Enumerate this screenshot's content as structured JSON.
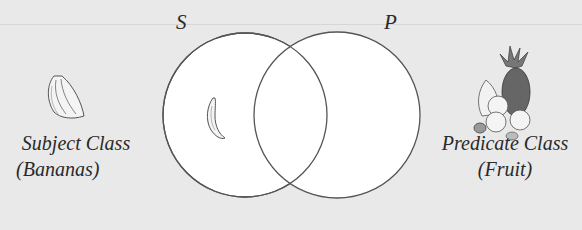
{
  "diagram": {
    "type": "venn",
    "circles": [
      {
        "id": "S",
        "label": "S",
        "cx": 245,
        "cy": 115,
        "r": 82
      },
      {
        "id": "P",
        "label": "P",
        "cx": 337,
        "cy": 115,
        "r": 83
      }
    ],
    "subject": {
      "title": "Subject Class",
      "subtitle": "(Bananas)",
      "icon": "banana-bunch-icon"
    },
    "predicate": {
      "title": "Predicate Class",
      "subtitle": "(Fruit)",
      "icon": "fruit-basket-icon"
    },
    "inner_icon": "single-banana-icon",
    "colors": {
      "background": "#e9e9e9",
      "circle_fill": "#ffffff",
      "stroke": "#555555"
    }
  }
}
